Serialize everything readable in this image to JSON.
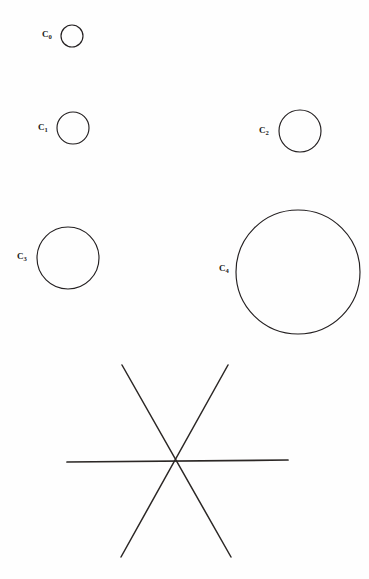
{
  "figure": {
    "background_color": "#fefefe",
    "stroke_color": "#231f20",
    "width": 369,
    "height": 579,
    "circles": [
      {
        "id": "c0",
        "label": "C",
        "subscript": "0",
        "cx": 72,
        "cy": 36,
        "r": 11,
        "label_x": 47,
        "label_y": 34
      },
      {
        "id": "c1",
        "label": "C",
        "subscript": "1",
        "cx": 73,
        "cy": 128,
        "r": 16,
        "label_x": 43,
        "label_y": 127
      },
      {
        "id": "c2",
        "label": "C",
        "subscript": "2",
        "cx": 300,
        "cy": 131,
        "r": 21,
        "label_x": 264,
        "label_y": 130
      },
      {
        "id": "c3",
        "label": "C",
        "subscript": "3",
        "cx": 68,
        "cy": 258,
        "r": 31,
        "label_x": 22,
        "label_y": 256
      },
      {
        "id": "c4",
        "label": "C",
        "subscript": "4",
        "cx": 298,
        "cy": 272,
        "r": 62,
        "label_x": 224,
        "label_y": 268
      }
    ],
    "asterisk": {
      "center_x": 176,
      "center_y": 461,
      "lines": [
        {
          "id": "horizontal",
          "x1": 67,
          "y1": 462,
          "x2": 288,
          "y2": 460
        },
        {
          "id": "diagonal-down",
          "x1": 122,
          "y1": 365,
          "x2": 231,
          "y2": 557
        },
        {
          "id": "diagonal-up",
          "x1": 228,
          "y1": 365,
          "x2": 121,
          "y2": 557
        }
      ]
    }
  }
}
